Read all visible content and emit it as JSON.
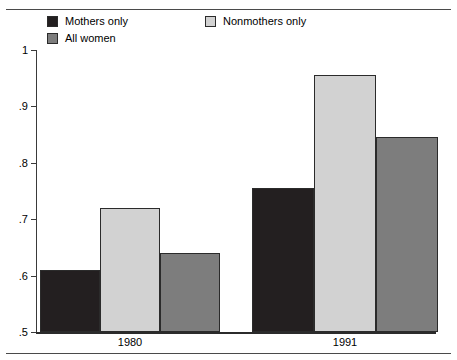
{
  "chart_data": {
    "type": "bar",
    "title": "",
    "subtitle": "",
    "xlabel": "",
    "ylabel": "",
    "categories": [
      "1980",
      "1991"
    ],
    "series": [
      {
        "name": "Mothers only",
        "values": [
          0.61,
          0.755
        ],
        "color": "#231f20"
      },
      {
        "name": "Nonmothers only",
        "values": [
          0.72,
          0.955
        ],
        "color": "#d2d2d2"
      },
      {
        "name": "All women",
        "values": [
          0.64,
          0.845
        ],
        "color": "#7d7d7d"
      }
    ],
    "ylim": [
      0.5,
      1.0
    ],
    "yticks": [
      0.5,
      0.6,
      0.7,
      0.8,
      0.9,
      1.0
    ],
    "ytick_labels": [
      ".5",
      ".6",
      ".7",
      ".8",
      ".9",
      "1"
    ],
    "grid": false,
    "legend_position": "top-left"
  },
  "legend": {
    "entries": [
      {
        "label": "Mothers only",
        "color": "#231f20",
        "swatch": "legend-swatch-mothers-only"
      },
      {
        "label": "Nonmothers only",
        "color": "#d2d2d2",
        "swatch": "legend-swatch-nonmothers-only"
      },
      {
        "label": "All women",
        "color": "#7d7d7d",
        "swatch": "legend-swatch-all-women"
      }
    ]
  },
  "axis": {
    "y_labels": [
      "1",
      ".9",
      ".8",
      ".7",
      ".6",
      ".5"
    ],
    "x_labels": [
      "1980",
      "1991"
    ]
  },
  "colors": {
    "mothers_only": "#231f20",
    "nonmothers_only": "#d2d2d2",
    "all_women": "#7d7d7d",
    "axis": "#2b2b2b",
    "rule": "#4a4a4a",
    "background": "#ffffff"
  }
}
